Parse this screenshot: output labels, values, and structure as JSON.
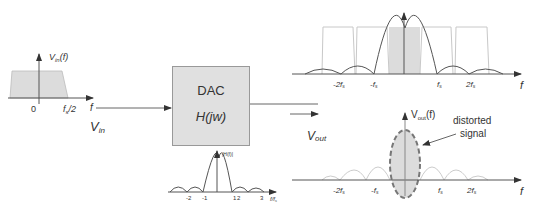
{
  "input": {
    "spectrum_label": "V",
    "spectrum_label_sub": "in",
    "spectrum_label_suffix": "(f)",
    "tick_zero": "0",
    "tick_half": "f",
    "tick_half_sub": "s",
    "tick_half_suffix": "/2",
    "axis_label": "f",
    "signal_label": "V",
    "signal_label_sub": "in"
  },
  "dac": {
    "title": "DAC",
    "transfer_function": "H(jw)"
  },
  "dac_response": {
    "label": "|H(f)|",
    "ticks": [
      "-2",
      "-1",
      "1",
      "2",
      "3"
    ],
    "axis_label": "f/f",
    "axis_label_sub": "s"
  },
  "sampled_spectrum": {
    "ticks": [
      "-2f",
      "-f",
      "f",
      "2f"
    ],
    "tick_sub": "s",
    "axis_label": "f"
  },
  "output": {
    "signal_label": "V",
    "signal_label_sub": "out",
    "spectrum_label": "V",
    "spectrum_label_sub": "out",
    "spectrum_label_suffix": "(f)",
    "annotation_line1": "distorted",
    "annotation_line2": "signal",
    "ticks": [
      "-2f",
      "-f",
      "f",
      "2f"
    ],
    "tick_sub": "s",
    "axis_label": "f"
  },
  "colors": {
    "fill_gray": "#dcdcdc",
    "line": "#444444",
    "light_line": "#bbbbbb",
    "dashed_ellipse": "#777777"
  }
}
